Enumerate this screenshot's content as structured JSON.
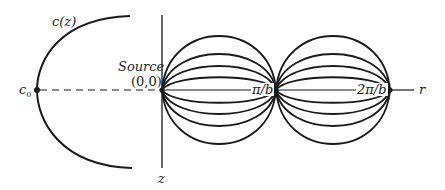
{
  "diagram": {
    "labels": {
      "curve": "c(z)",
      "c0_main": "c",
      "c0_sub": "0",
      "source_word": "Source",
      "source_coords": "(0,0)",
      "pi_over_b": "π/b",
      "two_pi_over_b": "2π/b",
      "r_axis": "r",
      "z_axis": "z"
    },
    "colors": {
      "stroke": "#1a1a1a",
      "background": "#ffffff"
    },
    "geometry": {
      "source_point": [
        162,
        90
      ],
      "focus_1": [
        276,
        90
      ],
      "focus_2": [
        390,
        90
      ],
      "c0_point": [
        37,
        90
      ],
      "arc_peak_offsets": [
        16,
        28,
        39,
        50
      ]
    }
  }
}
